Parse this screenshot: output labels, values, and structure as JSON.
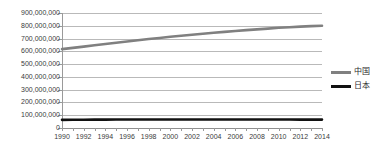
{
  "chart_data": {
    "type": "line",
    "title": "",
    "xlabel": "",
    "ylabel": "",
    "x": [
      1990,
      1991,
      1992,
      1993,
      1994,
      1995,
      1996,
      1997,
      1998,
      1999,
      2000,
      2001,
      2002,
      2003,
      2004,
      2005,
      2006,
      2007,
      2008,
      2009,
      2010,
      2011,
      2012,
      2013,
      2014
    ],
    "tick_labels": [
      "1990",
      "1992",
      "1994",
      "1996",
      "1998",
      "2000",
      "2002",
      "2004",
      "2006",
      "2008",
      "2010",
      "2012",
      "2014"
    ],
    "ytick_labels": [
      "0",
      "100,000,000",
      "200,000,000",
      "300,000,000",
      "400,000,000",
      "500,000,000",
      "600,000,000",
      "700,000,000",
      "800,000,000",
      "900,000,000"
    ],
    "ylim": [
      0,
      900000000
    ],
    "ytick_step": 100000000,
    "grid": true,
    "legend_position": "right",
    "series": [
      {
        "name": "中国",
        "color": "#808080",
        "values": [
          617000000,
          627000000,
          637000000,
          647000000,
          657000000,
          667000000,
          677000000,
          687000000,
          696000000,
          705000000,
          714000000,
          722000000,
          730000000,
          738000000,
          745000000,
          752000000,
          759000000,
          766000000,
          772000000,
          778000000,
          784000000,
          789000000,
          793000000,
          797000000,
          800000000
        ]
      },
      {
        "name": "日本",
        "color": "#111111",
        "values": [
          63840000,
          64500000,
          65100000,
          65500000,
          65800000,
          66000000,
          66200000,
          66500000,
          66800000,
          66900000,
          67000000,
          66900000,
          66800000,
          66700000,
          66600000,
          66500000,
          66600000,
          66700000,
          66800000,
          66500000,
          66300000,
          66100000,
          65900000,
          65800000,
          65700000
        ]
      }
    ]
  }
}
